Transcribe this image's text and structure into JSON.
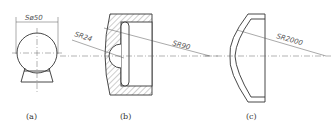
{
  "figures": [
    {
      "caption": "(a)",
      "dimension": "Sø50"
    },
    {
      "caption": "(b)",
      "dimensions": [
        "SR24",
        "SR90"
      ]
    },
    {
      "caption": "(c)",
      "dimension": "SR2000"
    }
  ]
}
